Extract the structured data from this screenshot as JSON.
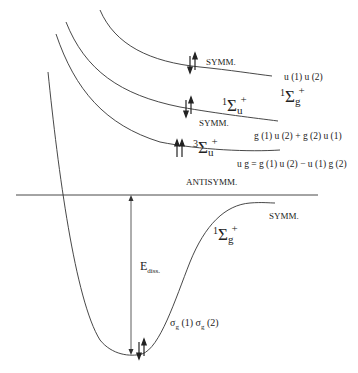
{
  "diagram": {
    "type": "potential-energy-curves",
    "curves": [
      {
        "id": "upper-1sg",
        "symmetry_label": "SYMM.",
        "wavefunction": "u (1) u (2)",
        "term": {
          "mult": "1",
          "sym": "Σ",
          "sub": "g",
          "sup": "+"
        },
        "spins": "↓↑"
      },
      {
        "id": "middle-1su",
        "symmetry_label": "SYMM.",
        "wavefunction": "g (1) u (2) + g (2) u (1)",
        "term": {
          "mult": "1",
          "sym": "Σ",
          "sub": "u",
          "sup": "+"
        },
        "spins": "↓↑"
      },
      {
        "id": "lower-3su",
        "symmetry_label": "ANTISYMM.",
        "wavefunction": "u g = g (1) u (2) − u (1) g (2)",
        "term": {
          "mult": "3",
          "sym": "Σ",
          "sub": "u",
          "sup": "+"
        },
        "spins": "↑↑"
      },
      {
        "id": "ground-1sg",
        "symmetry_label": "SYMM.",
        "wavefunction": "σ",
        "wavefunction_full": "σg (1) σg (2)",
        "term": {
          "mult": "1",
          "sym": "Σ",
          "sub": "g",
          "sup": "+"
        },
        "spins": "↓↑"
      }
    ],
    "dissociation": {
      "label": "E",
      "sub": "diss."
    },
    "orbital": {
      "s1": "σ",
      "g1": "g",
      "p1": " (1) ",
      "s2": "σ",
      "g2": "g",
      "p2": " (2)"
    }
  },
  "labels": {
    "symm_top": "SYMM.",
    "uu": "u (1) u (2)",
    "symm_mid": "SYMM.",
    "gu_plus": "g (1) u (2) + g (2) u (1)",
    "ug_minus": "u g = g (1) u (2) − u (1) g (2)",
    "antisymm": "ANTISYMM.",
    "symm_ground": "SYMM.",
    "spin_pair": "↓↑",
    "spin_parallel": "↑↑",
    "term_1sg_top": {
      "mult": "1",
      "sym": "Σ",
      "sub": "g",
      "sup": "+"
    },
    "term_1su": {
      "mult": "1",
      "sym": "Σ",
      "sub": "u",
      "sup": "+"
    },
    "term_3su": {
      "mult": "3",
      "sym": "Σ",
      "sub": "u",
      "sup": "+"
    },
    "term_1sg_ground": {
      "mult": "1",
      "sym": "Σ",
      "sub": "g",
      "sup": "+"
    }
  },
  "colors": {
    "line": "#333333",
    "text": "#222222",
    "background": "#ffffff"
  }
}
